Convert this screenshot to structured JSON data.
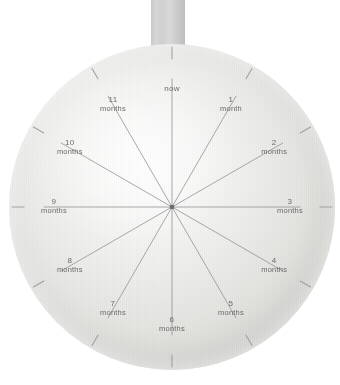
{
  "artifact": {
    "type": "dial-wheel-photo",
    "description": "Circular paper dial with radial spokes marking month intervals, hanging from a fabric strap"
  },
  "colors": {
    "disc_light": "#fdfdfd",
    "disc_mid": "#e4e4e1",
    "disc_edge": "#c7c7c2",
    "strap": "#d2d2d2",
    "line": "#8e8e8e",
    "text": "#6a6a6a",
    "hub": "#6b6b6b",
    "artifact": "#4a4a4e",
    "background": "#ffffff"
  },
  "dial": {
    "center": {
      "x": 172,
      "y": 207
    },
    "radius": 163,
    "spoke_count": 12,
    "spoke_inner_radius": 0,
    "tick_inner_radius": 148,
    "tick_outer_radius": 160,
    "label_radius": 118,
    "marks": [
      {
        "index": 0,
        "angle_deg": 0,
        "number": "",
        "unit": "now",
        "label": "now"
      },
      {
        "index": 1,
        "angle_deg": 30,
        "number": "1",
        "unit": "month",
        "label": "1 month"
      },
      {
        "index": 2,
        "angle_deg": 60,
        "number": "2",
        "unit": "months",
        "label": "2 months"
      },
      {
        "index": 3,
        "angle_deg": 90,
        "number": "3",
        "unit": "months",
        "label": "3 months"
      },
      {
        "index": 4,
        "angle_deg": 120,
        "number": "4",
        "unit": "months",
        "label": "4 months"
      },
      {
        "index": 5,
        "angle_deg": 150,
        "number": "5",
        "unit": "months",
        "label": "5 months"
      },
      {
        "index": 6,
        "angle_deg": 180,
        "number": "6",
        "unit": "months",
        "label": "6 months"
      },
      {
        "index": 7,
        "angle_deg": 210,
        "number": "7",
        "unit": "months",
        "label": "7 months"
      },
      {
        "index": 8,
        "angle_deg": 240,
        "number": "8",
        "unit": "months",
        "label": "8 months"
      },
      {
        "index": 9,
        "angle_deg": 270,
        "number": "9",
        "unit": "months",
        "label": "9 months"
      },
      {
        "index": 10,
        "angle_deg": 300,
        "number": "10",
        "unit": "months",
        "label": "10 months"
      },
      {
        "index": 11,
        "angle_deg": 330,
        "number": "11",
        "unit": "months",
        "label": "11 months"
      }
    ]
  },
  "strap": {
    "label": "hanging-strap",
    "x": 151,
    "y": 0,
    "width": 34,
    "height": 72
  }
}
